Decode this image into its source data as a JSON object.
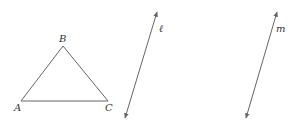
{
  "diagram": {
    "triangle": {
      "vertices": [
        {
          "label": "A",
          "x": 21,
          "y": 101,
          "lx": 14,
          "ly": 111
        },
        {
          "label": "B",
          "x": 63,
          "y": 46,
          "lx": 59,
          "ly": 42
        },
        {
          "label": "C",
          "x": 108,
          "y": 101,
          "lx": 105,
          "ly": 111
        }
      ]
    },
    "lines": [
      {
        "label": "ℓ",
        "x1": 157,
        "y1": 12,
        "x2": 125,
        "y2": 118,
        "lx": 159,
        "ly": 32
      },
      {
        "label": "m",
        "x1": 277,
        "y1": 12,
        "x2": 246,
        "y2": 118,
        "lx": 276,
        "ly": 32
      }
    ],
    "stroke_color": "#666666",
    "text_color": "#333333"
  }
}
